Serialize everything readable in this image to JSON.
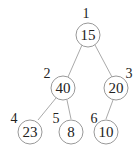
{
  "diagram": {
    "type": "binary-tree",
    "nodes": [
      {
        "index": "1",
        "value": "15"
      },
      {
        "index": "2",
        "value": "40"
      },
      {
        "index": "3",
        "value": "20"
      },
      {
        "index": "4",
        "value": "23"
      },
      {
        "index": "5",
        "value": "8"
      },
      {
        "index": "6",
        "value": "10"
      }
    ],
    "edges": [
      [
        "1",
        "2"
      ],
      [
        "1",
        "3"
      ],
      [
        "2",
        "4"
      ],
      [
        "2",
        "5"
      ],
      [
        "3",
        "6"
      ]
    ]
  }
}
